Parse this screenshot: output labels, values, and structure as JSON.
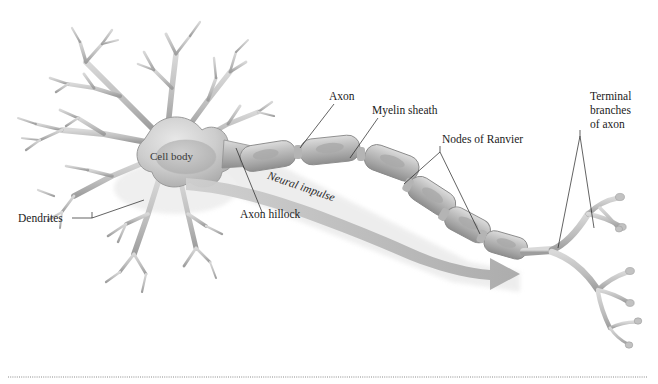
{
  "figure": {
    "background_color": "#ffffff",
    "label_color": "#1b1b1b",
    "structure_fill": "#c9c9c9",
    "structure_stroke": "#8f8f8f",
    "shadow_color": "#e3e3e3",
    "impulse_arrow_color": "#b5b5b5"
  },
  "labels": {
    "dendrites": "Dendrites",
    "cell_body": "Cell body",
    "axon_hillock": "Axon hillock",
    "axon": "Axon",
    "myelin_sheath": "Myelin sheath",
    "nodes_of_ranvier": "Nodes of Ranvier",
    "neural_impulse": "Neural impulse",
    "terminal_branches": {
      "line1": "Terminal",
      "line2": "branches",
      "line3": "of axon"
    }
  },
  "diagram_parts": [
    {
      "name": "dendrites",
      "count_primary_branches": 9
    },
    {
      "name": "cell-body",
      "shape": "lobed-soma-with-nucleus"
    },
    {
      "name": "axon-hillock",
      "shape": "tapered-cone"
    },
    {
      "name": "myelin-segments",
      "count": 7
    },
    {
      "name": "nodes-of-ranvier",
      "count": 6
    },
    {
      "name": "neural-impulse-arrow",
      "direction": "left-to-right"
    },
    {
      "name": "terminal-branches",
      "count_endings": 7
    }
  ],
  "footer": {
    "rule": "dotted-separator"
  }
}
